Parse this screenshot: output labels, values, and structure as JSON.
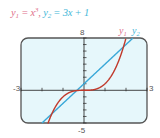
{
  "title": {
    "y1_label": "y",
    "y1_sub": "1",
    "y1_rhs": " = x",
    "y1_exp": "3",
    "sep": ", ",
    "y2_label": "y",
    "y2_sub": "2",
    "y2_rhs": " = 3x + 1"
  },
  "legend": {
    "y1": "y",
    "y1_sub": "1",
    "y2": "y",
    "y2_sub": "2"
  },
  "window": {
    "xmin_label": "-3",
    "xmax_label": "3",
    "ymin_label": "-5",
    "ymax_label": "8"
  },
  "colors": {
    "y1": "#c0392b",
    "y2": "#3aa8d8",
    "screen": "#e6f7fb",
    "frame": "#555555",
    "y1_text": "#e0708a",
    "y2_text": "#45b8d8"
  },
  "chart_data": {
    "type": "line",
    "xlabel": "",
    "ylabel": "",
    "xlim": [
      -3,
      3
    ],
    "ylim": [
      -5,
      8
    ],
    "grid": false,
    "legend_position": "top-right",
    "series": [
      {
        "name": "y1 = x^3",
        "color": "#c0392b",
        "x": [
          -1.71,
          -1.5,
          -1.0,
          -0.5,
          0,
          0.5,
          1.0,
          1.5,
          2.0
        ],
        "y": [
          -5,
          -3.375,
          -1,
          -0.125,
          0,
          0.125,
          1,
          3.375,
          8
        ]
      },
      {
        "name": "y2 = 3x + 1",
        "color": "#3aa8d8",
        "x": [
          -2,
          -1,
          0,
          1,
          2,
          2.33
        ],
        "y": [
          -5,
          -2,
          1,
          4,
          7,
          8
        ]
      }
    ],
    "intersections": [
      [
        -1.53,
        -3.6
      ],
      [
        -0.35,
        -0.04
      ],
      [
        1.88,
        6.6
      ]
    ],
    "xticks": [
      -3,
      -2,
      -1,
      0,
      1,
      2,
      3
    ],
    "yticks": [
      -5,
      -4,
      -3,
      -2,
      -1,
      0,
      1,
      2,
      3,
      4,
      5,
      6,
      7,
      8
    ]
  }
}
